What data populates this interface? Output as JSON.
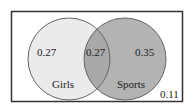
{
  "diagram": {
    "type": "venn",
    "universe": {
      "outside_value": "0.11"
    },
    "sets": [
      {
        "name": "Girls",
        "label": "Girls",
        "only_value": "0.27",
        "fill": "#ebebeb"
      },
      {
        "name": "Sports",
        "label": "Sports",
        "only_value": "0.35",
        "fill": "#b3b3b3"
      }
    ],
    "intersection": {
      "value": "0.27",
      "fill": "#a9a9a9"
    },
    "colors": {
      "border": "#333333",
      "circle_stroke": "#666666",
      "text": "#222222"
    }
  }
}
